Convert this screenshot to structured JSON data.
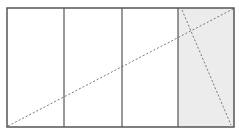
{
  "diagram": {
    "background": "#ffffff",
    "frame": {
      "x": 7,
      "y": 8,
      "width": 227,
      "height": 119,
      "stroke": "#555555",
      "stroke_width": 1.5
    },
    "panels": [
      {
        "id": "panel-1",
        "x": 7,
        "y": 8,
        "width": 57,
        "height": 119,
        "fill": "#ffffff"
      },
      {
        "id": "panel-2",
        "x": 64,
        "y": 8,
        "width": 58,
        "height": 119,
        "fill": "#ffffff"
      },
      {
        "id": "panel-3",
        "x": 122,
        "y": 8,
        "width": 56,
        "height": 119,
        "fill": "#ffffff"
      },
      {
        "id": "panel-4",
        "x": 178,
        "y": 8,
        "width": 56,
        "height": 119,
        "fill": "#ececec"
      }
    ],
    "dividers": [
      64,
      122,
      178
    ],
    "dashed_lines": [
      {
        "id": "diagonal-long",
        "x1": 8,
        "y1": 126,
        "x2": 233,
        "y2": 9,
        "stroke": "#777777"
      },
      {
        "id": "diagonal-steep",
        "x1": 182,
        "y1": 10,
        "x2": 231,
        "y2": 125,
        "stroke": "#777777"
      }
    ]
  }
}
